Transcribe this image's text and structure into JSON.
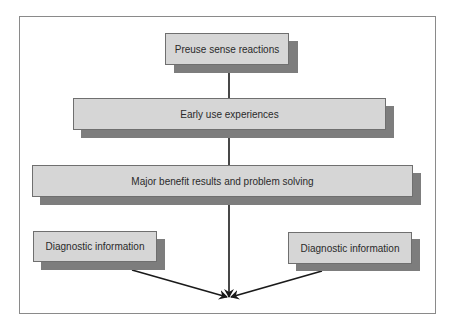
{
  "diagram": {
    "type": "flowchart",
    "nodes": [
      {
        "id": "preuse",
        "label": "Preuse sense reactions"
      },
      {
        "id": "early",
        "label": "Early use experiences"
      },
      {
        "id": "major",
        "label": "Major benefit results and problem solving"
      },
      {
        "id": "diag_left",
        "label": "Diagnostic information"
      },
      {
        "id": "diag_right",
        "label": "Diagnostic information"
      }
    ],
    "edges": [
      {
        "from": "preuse",
        "to": "early",
        "style": "line"
      },
      {
        "from": "early",
        "to": "major",
        "style": "line"
      },
      {
        "from": "major",
        "to": "convergence-point",
        "style": "arrow"
      },
      {
        "from": "diag_left",
        "to": "convergence-point",
        "style": "arrow"
      },
      {
        "from": "diag_right",
        "to": "convergence-point",
        "style": "arrow"
      }
    ]
  },
  "colors": {
    "box_fill": "#d6d6d6",
    "box_shadow": "#7d7d7d",
    "line": "#1a1a1a",
    "frame": "#8a8a8a"
  }
}
